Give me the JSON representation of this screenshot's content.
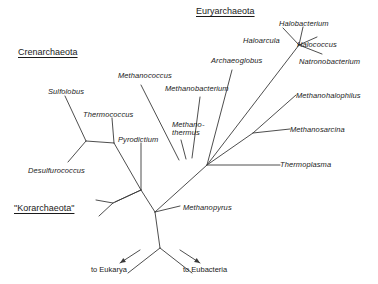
{
  "figure": {
    "type": "unrooted-phylogenetic-tree",
    "width": 378,
    "height": 284,
    "background_color": "#ffffff",
    "line_color": "#3a3a3a"
  },
  "group_labels": [
    {
      "id": "crenarchaeota",
      "text": "Crenarchaeota",
      "x": 18,
      "y": 47,
      "underlined": true
    },
    {
      "id": "euryarchaeota",
      "text": "Euryarchaeota",
      "x": 196,
      "y": 6,
      "underlined": true
    },
    {
      "id": "korarchaeota",
      "text": "\"Korarchaeota\"",
      "x": 14,
      "y": 203,
      "underlined": true
    }
  ],
  "taxa": [
    {
      "id": "sulfolobus",
      "text": "Sulfolobus",
      "x": 48,
      "y": 88
    },
    {
      "id": "thermococcus",
      "text": "Thermococcus",
      "x": 83,
      "y": 111
    },
    {
      "id": "pyrodictium",
      "text": "Pyrodictium",
      "x": 118,
      "y": 136
    },
    {
      "id": "desulfurococcus",
      "text": "Desulfurococcus",
      "x": 28,
      "y": 167
    },
    {
      "id": "methanococcus",
      "text": "Methanococcus",
      "x": 118,
      "y": 72
    },
    {
      "id": "methanobacterium",
      "text": "Methanobacterium",
      "x": 165,
      "y": 85
    },
    {
      "id": "methanothermus",
      "text": "Methano-\nthermus",
      "line1": "Methano-",
      "line2": "thermus",
      "x": 172,
      "y": 121
    },
    {
      "id": "archaeoglobus",
      "text": "Archaeoglobus",
      "x": 211,
      "y": 57
    },
    {
      "id": "haloarcula",
      "text": "Haloarcula",
      "x": 243,
      "y": 37
    },
    {
      "id": "halobacterium",
      "text": "Halobacterium",
      "x": 279,
      "y": 20
    },
    {
      "id": "halococcus",
      "text": "Halococcus",
      "x": 297,
      "y": 41
    },
    {
      "id": "natronobacterium",
      "text": "Natronobacterium",
      "x": 299,
      "y": 58
    },
    {
      "id": "methanohalophilus",
      "text": "Methanohalophilus",
      "x": 296,
      "y": 92
    },
    {
      "id": "methanosarcina",
      "text": "Methanosarcina",
      "x": 290,
      "y": 126
    },
    {
      "id": "thermoplasma",
      "text": "Thermoplasma",
      "x": 280,
      "y": 161
    },
    {
      "id": "methanopyrus",
      "text": "Methanopyrus",
      "x": 183,
      "y": 204
    }
  ],
  "outgroup_labels": [
    {
      "id": "to-eukarya",
      "text": "to Eukarya",
      "x": 91,
      "y": 265
    },
    {
      "id": "to-eubacteria",
      "text": "to Eubacteria",
      "x": 183,
      "y": 265
    }
  ],
  "branches": [
    {
      "id": "branch-sulfolobus",
      "from": [
        86,
        141
      ],
      "to": [
        65,
        96
      ],
      "leaf": "sulfolobus"
    },
    {
      "id": "branch-thermococcus",
      "from": [
        114,
        143
      ],
      "to": [
        112,
        118
      ],
      "leaf": "thermococcus"
    },
    {
      "id": "branch-pyrodictium",
      "from": [
        141,
        190
      ],
      "to": [
        141,
        143
      ],
      "leaf": "pyrodictium"
    },
    {
      "id": "branch-desulfurococcus",
      "from": [
        86,
        141
      ],
      "to": [
        68,
        162
      ],
      "leaf": "desulfurococcus"
    },
    {
      "id": "node-cren-a-to-b",
      "from": [
        86,
        141
      ],
      "to": [
        114,
        143
      ]
    },
    {
      "id": "node-cren-b-to-c",
      "from": [
        114,
        143
      ],
      "to": [
        141,
        190
      ]
    },
    {
      "id": "node-cren-to-root",
      "from": [
        141,
        190
      ],
      "to": [
        155,
        212
      ]
    },
    {
      "id": "branch-korarchaeota-upper",
      "from": [
        115,
        202
      ],
      "to": [
        141,
        190
      ]
    },
    {
      "id": "branch-korarchaeota-fork-up",
      "from": [
        113,
        203
      ],
      "to": [
        96,
        200
      ]
    },
    {
      "id": "branch-korarchaeota-fork-down",
      "from": [
        113,
        203
      ],
      "to": [
        99,
        216
      ]
    },
    {
      "id": "branch-korar-to-node",
      "from": [
        113,
        203
      ],
      "to": [
        141,
        190
      ]
    },
    {
      "id": "branch-methanopyrus",
      "from": [
        155,
        212
      ],
      "to": [
        180,
        206
      ],
      "leaf": "methanopyrus"
    },
    {
      "id": "node-root-to-eury",
      "from": [
        155,
        212
      ],
      "to": [
        207,
        165
      ]
    },
    {
      "id": "branch-methanococcus",
      "from": [
        179,
        160
      ],
      "to": [
        141,
        85
      ],
      "leaf": "methanococcus"
    },
    {
      "id": "branch-methanothermus",
      "from": [
        186,
        159
      ],
      "to": [
        181,
        140
      ],
      "leaf": "methanothermus"
    },
    {
      "id": "branch-methanobacterium",
      "from": [
        192,
        158
      ],
      "to": [
        200,
        97
      ],
      "leaf": "methanobacterium"
    },
    {
      "id": "branch-archaeoglobus",
      "from": [
        207,
        165
      ],
      "to": [
        232,
        70
      ],
      "leaf": "archaeoglobus"
    },
    {
      "id": "branch-eury-to-halo",
      "from": [
        207,
        165
      ],
      "to": [
        299,
        45
      ]
    },
    {
      "id": "branch-haloarcula",
      "from": [
        299,
        45
      ],
      "to": [
        283,
        28
      ],
      "leaf": "haloarcula"
    },
    {
      "id": "branch-halobacterium",
      "from": [
        299,
        45
      ],
      "to": [
        303,
        27
      ],
      "leaf": "halobacterium"
    },
    {
      "id": "branch-halococcus",
      "from": [
        299,
        45
      ],
      "to": [
        317,
        37
      ],
      "leaf": "halococcus"
    },
    {
      "id": "branch-natronobacterium",
      "from": [
        299,
        45
      ],
      "to": [
        322,
        54
      ],
      "leaf": "natronobacterium"
    },
    {
      "id": "branch-meth-node",
      "from": [
        207,
        165
      ],
      "to": [
        253,
        133
      ]
    },
    {
      "id": "branch-methanohalophilus",
      "from": [
        253,
        133
      ],
      "to": [
        296,
        95
      ],
      "leaf": "methanohalophilus"
    },
    {
      "id": "branch-methanosarcina",
      "from": [
        253,
        133
      ],
      "to": [
        290,
        129
      ],
      "leaf": "methanosarcina"
    },
    {
      "id": "branch-thermoplasma",
      "from": [
        207,
        165
      ],
      "to": [
        280,
        165
      ],
      "leaf": "thermoplasma"
    },
    {
      "id": "branch-root-to-outgroups",
      "from": [
        155,
        212
      ],
      "to": [
        160,
        248
      ]
    },
    {
      "id": "branch-to-eukarya",
      "from": [
        160,
        248
      ],
      "to": [
        128,
        273
      ],
      "arrow": true
    },
    {
      "id": "branch-to-eubacteria",
      "from": [
        160,
        248
      ],
      "to": [
        192,
        273
      ],
      "arrow": true
    }
  ],
  "arrows": [
    {
      "id": "arrow-eukarya",
      "tip": [
        120,
        263
      ],
      "tail": [
        140,
        250
      ],
      "points_to": "to-eukarya"
    },
    {
      "id": "arrow-eubacteria",
      "tip": [
        200,
        263
      ],
      "tail": [
        180,
        250
      ],
      "points_to": "to-eubacteria"
    }
  ]
}
